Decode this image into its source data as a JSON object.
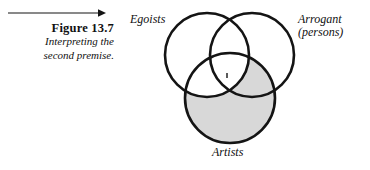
{
  "figure": {
    "number_label": "Figure 13.7",
    "description_line1": "Interpreting the",
    "description_line2": "second premise.",
    "rule_arrow_icon": "right-arrow-rule-icon"
  },
  "diagram": {
    "type": "venn-three-circle",
    "stroke_color": "#141414",
    "stroke_width_px": 2.6,
    "fill_color": "#ffffff",
    "shade_color": "#d8d8d8",
    "circles": [
      {
        "id": "egoists",
        "label": "Egoists",
        "cx": 79,
        "cy": 55,
        "r": 42
      },
      {
        "id": "arrogant",
        "label_line1": "Arrogant",
        "label_line2": "(persons)",
        "cx": 124,
        "cy": 55,
        "r": 42
      },
      {
        "id": "artists",
        "label": "Artists",
        "cx": 102,
        "cy": 98,
        "r": 45
      }
    ],
    "shaded_region": {
      "description": "Artists circle excluding the portion overlapping the Egoists circle",
      "include_circle": "artists",
      "exclude_circle": "egoists"
    }
  },
  "chart_data": {
    "type": "diagram",
    "title": "Figure 13.7",
    "subtitle": "Interpreting the second premise.",
    "categories": [
      "Egoists",
      "Arrogant (persons)",
      "Artists"
    ],
    "annotations": [
      "Artists region shaded except where it overlaps Egoists"
    ]
  }
}
